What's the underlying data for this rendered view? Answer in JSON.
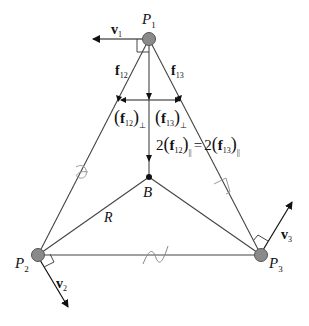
{
  "diagram": {
    "type": "triangle-force-diagram",
    "nodes": {
      "P1": {
        "label": "P",
        "sub": "1"
      },
      "P2": {
        "label": "P",
        "sub": "2"
      },
      "P3": {
        "label": "P",
        "sub": "3"
      },
      "B": {
        "label": "B"
      }
    },
    "vectors": {
      "v1": {
        "label": "v",
        "sub": "1"
      },
      "v2": {
        "label": "v",
        "sub": "2"
      },
      "v3": {
        "label": "v",
        "sub": "3"
      }
    },
    "forces": {
      "f12": {
        "label": "f",
        "sub": "12"
      },
      "f13": {
        "label": "f",
        "sub": "13"
      }
    },
    "perp_components": {
      "f12_perp": {
        "open": "(",
        "label": "f",
        "sub": "12",
        "close": ")",
        "sub2": "⊥"
      },
      "f13_perp": {
        "open": "(",
        "label": "f",
        "sub": "13",
        "close": ")",
        "sub2": "⊥"
      }
    },
    "parallel_equation": {
      "lhs_coef": "2",
      "lhs_label": "f",
      "lhs_sub": "12",
      "eq": "=",
      "rhs_coef": "2",
      "rhs_label": "f",
      "rhs_sub": "13",
      "par": "||"
    },
    "radius_label": "R",
    "colors": {
      "line": "#333333",
      "node_fill": "#8a8a8a",
      "node_stroke": "#555555",
      "tick": "#888888"
    }
  }
}
